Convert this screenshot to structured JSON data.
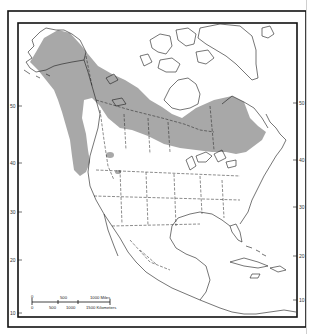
{
  "map": {
    "title": "",
    "region": "North America",
    "colors": {
      "range_fill": "#a8a8a8",
      "outline": "#1a1a1a",
      "frame": "#111111",
      "background": "#ffffff"
    },
    "latitude_labels_left": [
      "50",
      "40",
      "30",
      "20",
      "10"
    ],
    "latitude_labels_right": [
      "50",
      "40",
      "30",
      "20",
      "10"
    ],
    "scale_bar": {
      "miles_labels": [
        "0",
        "500",
        "1000 Miles"
      ],
      "km_labels": [
        "0",
        "500",
        "1000",
        "1500 Kilometers"
      ]
    }
  }
}
